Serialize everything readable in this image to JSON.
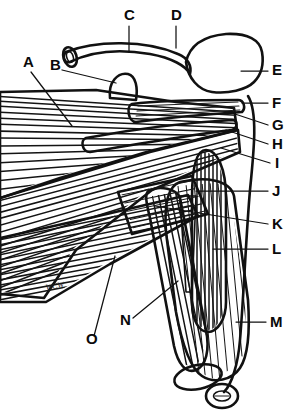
{
  "figure": {
    "type": "labeled anatomical line drawing",
    "artist_signature": "WCW",
    "background_color": "#ffffff",
    "ink_color": "#111111",
    "fill_gray": "#c9c9c9",
    "fill_gray_dark": "#a9a9a9",
    "stipple_color": "#d8d8d8"
  },
  "labels": [
    {
      "id": "A",
      "text": "A",
      "x": 23,
      "y": 67,
      "leader": {
        "x1": 31,
        "y1": 72,
        "x2": 72,
        "y2": 126
      }
    },
    {
      "id": "B",
      "text": "B",
      "x": 50,
      "y": 70,
      "leader": {
        "x1": 62,
        "y1": 70,
        "x2": 116,
        "y2": 83
      }
    },
    {
      "id": "C",
      "text": "C",
      "x": 124,
      "y": 20,
      "leader": {
        "x1": 129,
        "y1": 26,
        "x2": 129,
        "y2": 52
      }
    },
    {
      "id": "D",
      "text": "D",
      "x": 171,
      "y": 20,
      "leader": {
        "x1": 176,
        "y1": 26,
        "x2": 176,
        "y2": 48
      }
    },
    {
      "id": "E",
      "text": "E",
      "x": 272,
      "y": 75,
      "leader": {
        "x1": 268,
        "y1": 71,
        "x2": 241,
        "y2": 71
      }
    },
    {
      "id": "F",
      "text": "F",
      "x": 272,
      "y": 108,
      "leader": {
        "x1": 268,
        "y1": 103,
        "x2": 242,
        "y2": 103
      }
    },
    {
      "id": "G",
      "text": "G",
      "x": 272,
      "y": 130,
      "leader": {
        "x1": 268,
        "y1": 125,
        "x2": 229,
        "y2": 112
      }
    },
    {
      "id": "H",
      "text": "H",
      "x": 272,
      "y": 149,
      "leader": {
        "x1": 268,
        "y1": 144,
        "x2": 226,
        "y2": 130
      }
    },
    {
      "id": "I",
      "text": "I",
      "x": 275,
      "y": 168,
      "leader": {
        "x1": 270,
        "y1": 163,
        "x2": 221,
        "y2": 148
      }
    },
    {
      "id": "J",
      "text": "J",
      "x": 272,
      "y": 196,
      "leader": {
        "x1": 268,
        "y1": 191,
        "x2": 196,
        "y2": 191
      }
    },
    {
      "id": "K",
      "text": "K",
      "x": 272,
      "y": 229,
      "leader": {
        "x1": 268,
        "y1": 224,
        "x2": 155,
        "y2": 206
      }
    },
    {
      "id": "L",
      "text": "L",
      "x": 272,
      "y": 254,
      "leader": {
        "x1": 268,
        "y1": 249,
        "x2": 213,
        "y2": 249
      }
    },
    {
      "id": "M",
      "text": "M",
      "x": 270,
      "y": 327,
      "leader": {
        "x1": 266,
        "y1": 322,
        "x2": 236,
        "y2": 322
      }
    },
    {
      "id": "N",
      "text": "N",
      "x": 120,
      "y": 325,
      "leader": {
        "x1": 133,
        "y1": 318,
        "x2": 178,
        "y2": 281
      }
    },
    {
      "id": "O",
      "text": "O",
      "x": 86,
      "y": 344,
      "leader": {
        "x1": 94,
        "y1": 336,
        "x2": 115,
        "y2": 256
      }
    }
  ]
}
